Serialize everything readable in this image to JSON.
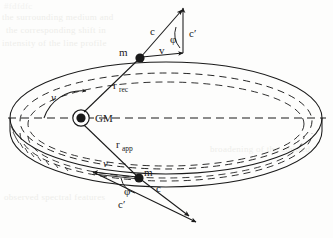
{
  "figure": {
    "domain": "diagram",
    "type": "orbital-kinematics-schematic",
    "background_color": "#fdfdfc",
    "ink_color": "#1a1a1a"
  },
  "central_body": {
    "label": "GM",
    "name": "central-mass"
  },
  "orbit": {
    "true_anomaly_label": "ν",
    "rotation_sense": "counter-clockwise"
  },
  "particles": {
    "receding": {
      "mass_label": "m",
      "radius_label": "r",
      "radius_subscript": "rec",
      "velocity_label": "v",
      "photon_label": "c",
      "photon_prime_label": "c′",
      "angle_label": "φ"
    },
    "approaching": {
      "mass_label": "m",
      "radius_label": "r",
      "radius_subscript": "app",
      "velocity_label": "v",
      "photon_label": "c",
      "photon_prime_label": "c′",
      "angle_label": "φ"
    }
  },
  "bleed_through_text": {
    "note": "faint show-through of printing on the reverse side of the scanned page",
    "lines": [
      "the surrounding medium and",
      "the corresponding shift in",
      "intensity of the line profile",
      "broadening of the emitted",
      "observed spectral features"
    ]
  }
}
